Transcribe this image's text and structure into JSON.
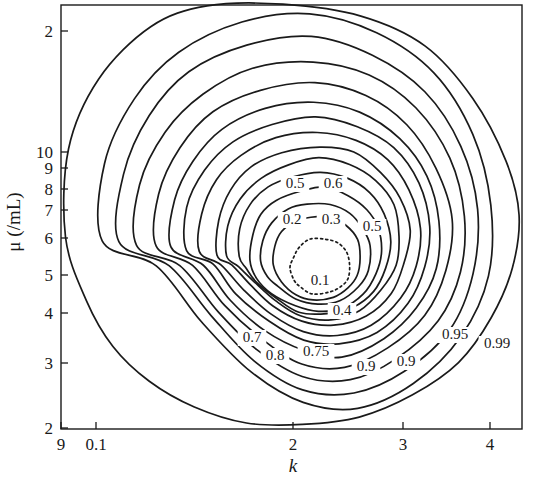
{
  "figure": {
    "type": "contour-plot",
    "background": "#ffffff",
    "line_color": "#1a1a1a"
  },
  "axes": {
    "x": {
      "label": "k",
      "scale": "log",
      "tick_labels": [
        "9",
        "0.1",
        "2",
        "3",
        "4"
      ],
      "tick_values": [
        0.09,
        0.1,
        2,
        3,
        4
      ],
      "tick_px": [
        61,
        96,
        293,
        403,
        490
      ],
      "range_px": [
        61,
        522
      ]
    },
    "y": {
      "label": "μ (/mL)",
      "scale": "log",
      "tick_labels": [
        "2",
        "10",
        "9",
        "8",
        "7",
        "6",
        "5",
        "4",
        "3",
        "2"
      ],
      "tick_values": [
        20,
        10,
        9,
        8,
        7,
        6,
        5,
        4,
        3,
        2
      ],
      "tick_px": [
        31,
        152,
        168,
        189,
        210,
        238,
        275,
        313,
        363,
        428
      ],
      "range_px": [
        5,
        429
      ]
    },
    "frame_px": {
      "left": 61,
      "top": 5,
      "right": 522,
      "bottom": 429
    }
  },
  "chart_data": {
    "type": "line",
    "title": "",
    "xlabel": "k",
    "ylabel": "μ (/mL)",
    "xscale": "log",
    "yscale": "log",
    "xlim": [
      0.09,
      4.4
    ],
    "ylim": [
      2,
      21
    ],
    "grid": false,
    "legend": "none",
    "levels": [
      0.1,
      0.2,
      0.3,
      0.4,
      0.5,
      0.5,
      0.6,
      0.7,
      0.75,
      0.8,
      0.9,
      0.9,
      0.95,
      0.99
    ],
    "contour_labels": [
      {
        "level": "0.5",
        "x_px": 295,
        "y_px": 188
      },
      {
        "level": "0.6",
        "x_px": 333,
        "y_px": 188
      },
      {
        "level": "0.2",
        "x_px": 292,
        "y_px": 224
      },
      {
        "level": "0.3",
        "x_px": 331,
        "y_px": 224
      },
      {
        "level": "0.5",
        "x_px": 372,
        "y_px": 231
      },
      {
        "level": "0.1",
        "x_px": 320,
        "y_px": 285
      },
      {
        "level": "0.4",
        "x_px": 342,
        "y_px": 315
      },
      {
        "level": "0.7",
        "x_px": 252,
        "y_px": 342
      },
      {
        "level": "0.75",
        "x_px": 316,
        "y_px": 356
      },
      {
        "level": "0.8",
        "x_px": 275,
        "y_px": 360
      },
      {
        "level": "0.9",
        "x_px": 366,
        "y_px": 371
      },
      {
        "level": "0.9",
        "x_px": 406,
        "y_px": 366
      },
      {
        "level": "0.95",
        "x_px": 455,
        "y_px": 339
      },
      {
        "level": "0.99",
        "x_px": 497,
        "y_px": 348
      }
    ],
    "contours": [
      {
        "level": 0.1,
        "dashed": true,
        "points_px": [
          [
            291,
            268
          ],
          [
            293,
            256
          ],
          [
            300,
            246
          ],
          [
            311,
            240
          ],
          [
            325,
            238
          ],
          [
            338,
            242
          ],
          [
            347,
            252
          ],
          [
            350,
            264
          ],
          [
            348,
            277
          ],
          [
            341,
            287
          ],
          [
            328,
            293
          ],
          [
            313,
            293
          ],
          [
            301,
            287
          ],
          [
            293,
            279
          ]
        ]
      },
      {
        "level": 0.2,
        "dashed": false,
        "points_px": [
          [
            273,
            264
          ],
          [
            275,
            246
          ],
          [
            282,
            231
          ],
          [
            295,
            221
          ],
          [
            312,
            216
          ],
          [
            331,
            218
          ],
          [
            347,
            226
          ],
          [
            358,
            240
          ],
          [
            361,
            257
          ],
          [
            358,
            275
          ],
          [
            348,
            289
          ],
          [
            332,
            298
          ],
          [
            313,
            300
          ],
          [
            295,
            294
          ],
          [
            281,
            282
          ]
        ]
      },
      {
        "level": 0.3,
        "dashed": false,
        "points_px": [
          [
            262,
            262
          ],
          [
            264,
            241
          ],
          [
            272,
            223
          ],
          [
            287,
            210
          ],
          [
            307,
            203
          ],
          [
            329,
            204
          ],
          [
            349,
            212
          ],
          [
            363,
            227
          ],
          [
            369,
            247
          ],
          [
            367,
            269
          ],
          [
            357,
            288
          ],
          [
            339,
            300
          ],
          [
            317,
            304
          ],
          [
            295,
            299
          ],
          [
            277,
            287
          ],
          [
            267,
            275
          ]
        ]
      },
      {
        "level": 0.4,
        "dashed": false,
        "points_px": [
          [
            250,
            260
          ],
          [
            252,
            236
          ],
          [
            261,
            215
          ],
          [
            277,
            200
          ],
          [
            300,
            190
          ],
          [
            325,
            188
          ],
          [
            348,
            195
          ],
          [
            367,
            209
          ],
          [
            378,
            229
          ],
          [
            381,
            252
          ],
          [
            376,
            275
          ],
          [
            363,
            295
          ],
          [
            343,
            308
          ],
          [
            318,
            312
          ],
          [
            294,
            307
          ],
          [
            273,
            295
          ],
          [
            258,
            278
          ]
        ]
      },
      {
        "level": 0.5,
        "dashed": false,
        "points_px": [
          [
            238,
            258
          ],
          [
            240,
            230
          ],
          [
            250,
            206
          ],
          [
            268,
            188
          ],
          [
            293,
            176
          ],
          [
            321,
            172
          ],
          [
            348,
            178
          ],
          [
            370,
            193
          ],
          [
            385,
            215
          ],
          [
            391,
            241
          ],
          [
            387,
            267
          ],
          [
            374,
            291
          ],
          [
            353,
            307
          ],
          [
            327,
            315
          ],
          [
            300,
            311
          ],
          [
            276,
            299
          ],
          [
            257,
            281
          ],
          [
            245,
            270
          ]
        ]
      },
      {
        "level": 0.55,
        "dashed": false,
        "points_px": [
          [
            227,
            256
          ],
          [
            229,
            225
          ],
          [
            240,
            198
          ],
          [
            260,
            178
          ],
          [
            288,
            164
          ],
          [
            320,
            159
          ],
          [
            351,
            165
          ],
          [
            376,
            182
          ],
          [
            393,
            206
          ],
          [
            400,
            235
          ],
          [
            396,
            264
          ],
          [
            382,
            291
          ],
          [
            359,
            310
          ],
          [
            331,
            319
          ],
          [
            301,
            315
          ],
          [
            275,
            302
          ],
          [
            254,
            283
          ],
          [
            238,
            268
          ]
        ]
      },
      {
        "level": 0.6,
        "dashed": false,
        "points_px": [
          [
            216,
            254
          ],
          [
            218,
            220
          ],
          [
            230,
            190
          ],
          [
            252,
            168
          ],
          [
            283,
            152
          ],
          [
            319,
            147
          ],
          [
            353,
            153
          ],
          [
            381,
            172
          ],
          [
            400,
            199
          ],
          [
            409,
            231
          ],
          [
            405,
            263
          ],
          [
            390,
            293
          ],
          [
            365,
            315
          ],
          [
            334,
            325
          ],
          [
            302,
            321
          ],
          [
            274,
            307
          ],
          [
            250,
            286
          ],
          [
            232,
            266
          ]
        ]
      },
      {
        "level": 0.7,
        "dashed": false,
        "points_px": [
          [
            200,
            252
          ],
          [
            202,
            214
          ],
          [
            216,
            180
          ],
          [
            241,
            155
          ],
          [
            276,
            137
          ],
          [
            317,
            131
          ],
          [
            356,
            139
          ],
          [
            388,
            160
          ],
          [
            410,
            191
          ],
          [
            420,
            228
          ],
          [
            416,
            265
          ],
          [
            400,
            299
          ],
          [
            372,
            324
          ],
          [
            338,
            336
          ],
          [
            303,
            332
          ],
          [
            271,
            315
          ],
          [
            243,
            291
          ],
          [
            222,
            266
          ]
        ]
      },
      {
        "level": 0.75,
        "dashed": false,
        "points_px": [
          [
            186,
            250
          ],
          [
            188,
            208
          ],
          [
            204,
            171
          ],
          [
            232,
            143
          ],
          [
            271,
            124
          ],
          [
            316,
            117
          ],
          [
            358,
            126
          ],
          [
            394,
            149
          ],
          [
            418,
            184
          ],
          [
            430,
            225
          ],
          [
            426,
            266
          ],
          [
            408,
            303
          ],
          [
            377,
            331
          ],
          [
            340,
            345
          ],
          [
            303,
            341
          ],
          [
            268,
            322
          ],
          [
            237,
            294
          ],
          [
            212,
            265
          ]
        ]
      },
      {
        "level": 0.8,
        "dashed": false,
        "points_px": [
          [
            172,
            248
          ],
          [
            174,
            201
          ],
          [
            192,
            160
          ],
          [
            223,
            129
          ],
          [
            266,
            108
          ],
          [
            315,
            101
          ],
          [
            361,
            112
          ],
          [
            400,
            138
          ],
          [
            427,
            177
          ],
          [
            440,
            222
          ],
          [
            436,
            268
          ],
          [
            417,
            309
          ],
          [
            383,
            340
          ],
          [
            343,
            356
          ],
          [
            303,
            352
          ],
          [
            265,
            331
          ],
          [
            231,
            300
          ],
          [
            203,
            266
          ]
        ]
      },
      {
        "level": 0.85,
        "dashed": false,
        "points_px": [
          [
            156,
            246
          ],
          [
            159,
            193
          ],
          [
            179,
            147
          ],
          [
            213,
            113
          ],
          [
            260,
            90
          ],
          [
            314,
            83
          ],
          [
            365,
            96
          ],
          [
            407,
            125
          ],
          [
            437,
            169
          ],
          [
            451,
            219
          ],
          [
            447,
            270
          ],
          [
            426,
            315
          ],
          [
            389,
            349
          ],
          [
            346,
            367
          ],
          [
            303,
            363
          ],
          [
            262,
            340
          ],
          [
            225,
            305
          ],
          [
            193,
            266
          ]
        ]
      },
      {
        "level": 0.9,
        "dashed": false,
        "points_px": [
          [
            138,
            244
          ],
          [
            141,
            184
          ],
          [
            164,
            132
          ],
          [
            202,
            94
          ],
          [
            254,
            68
          ],
          [
            313,
            61
          ],
          [
            369,
            76
          ],
          [
            416,
            109
          ],
          [
            449,
            159
          ],
          [
            464,
            215
          ],
          [
            460,
            272
          ],
          [
            437,
            322
          ],
          [
            396,
            360
          ],
          [
            349,
            380
          ],
          [
            303,
            376
          ],
          [
            258,
            350
          ],
          [
            218,
            311
          ],
          [
            181,
            266
          ]
        ]
      },
      {
        "level": 0.93,
        "dashed": false,
        "points_px": [
          [
            119,
            242
          ],
          [
            123,
            174
          ],
          [
            148,
            116
          ],
          [
            190,
            73
          ],
          [
            247,
            45
          ],
          [
            312,
            37
          ],
          [
            373,
            54
          ],
          [
            425,
            91
          ],
          [
            461,
            147
          ],
          [
            478,
            210
          ],
          [
            474,
            274
          ],
          [
            449,
            330
          ],
          [
            404,
            372
          ],
          [
            353,
            394
          ],
          [
            303,
            390
          ],
          [
            254,
            361
          ],
          [
            210,
            317
          ],
          [
            168,
            266
          ]
        ]
      },
      {
        "level": 0.95,
        "dashed": false,
        "points_px": [
          [
            101,
            240
          ],
          [
            105,
            164
          ],
          [
            133,
            100
          ],
          [
            179,
            52
          ],
          [
            241,
            22
          ],
          [
            311,
            13
          ],
          [
            378,
            32
          ],
          [
            434,
            73
          ],
          [
            474,
            135
          ],
          [
            492,
            205
          ],
          [
            488,
            276
          ],
          [
            461,
            338
          ],
          [
            412,
            384
          ],
          [
            357,
            407
          ],
          [
            303,
            403
          ],
          [
            250,
            372
          ],
          [
            203,
            323
          ],
          [
            156,
            266
          ]
        ]
      },
      {
        "level": 0.99,
        "dashed": false,
        "points_px": [
          [
            66,
            238
          ],
          [
            70,
            150
          ],
          [
            100,
            78
          ],
          [
            150,
            28
          ],
          [
            208,
            6
          ],
          [
            282,
            5
          ],
          [
            360,
            16
          ],
          [
            425,
            47
          ],
          [
            472,
            99
          ],
          [
            505,
            160
          ],
          [
            520,
            215
          ],
          [
            513,
            268
          ],
          [
            492,
            318
          ],
          [
            458,
            362
          ],
          [
            412,
            396
          ],
          [
            360,
            417
          ],
          [
            303,
            425
          ],
          [
            247,
            423
          ],
          [
            195,
            407
          ],
          [
            150,
            381
          ],
          [
            113,
            345
          ],
          [
            86,
            300
          ]
        ]
      }
    ]
  }
}
